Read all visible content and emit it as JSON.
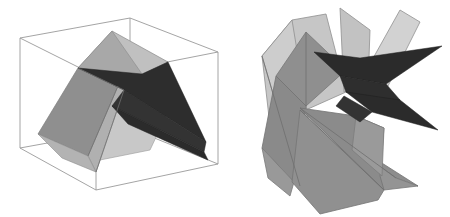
{
  "figure": {
    "title": "",
    "background_color": "#ffffff",
    "width": 450,
    "height": 217,
    "panels": [
      {
        "name": "left-panel",
        "label": "",
        "description": "Folded polygonal surface enclosed in a wireframe bounding box"
      },
      {
        "name": "right-panel",
        "label": "",
        "description": "Exploded arrangement of the same polygonal facets without bounding box"
      }
    ]
  },
  "palette": {
    "white": "#ffffff",
    "wireframe_stroke": "#8f8f8f",
    "outline_stroke": "#6e6e6e",
    "dark_face": "#2b2b2b",
    "dark_face_alt": "#333333",
    "mid_gray_face": "#8d8d8d",
    "mid_gray_face_b": "#999999",
    "light_gray_face": "#bdbdbd",
    "lighter_gray_face": "#cccccc",
    "pale_gray_face": "#d8d8d8",
    "shadow_gray": "#a6a6a6"
  },
  "left_panel": {
    "name": "wireframe-box-with-surface",
    "box_vertices": {
      "top_back_left": "20,38",
      "top_back_right": "130,18",
      "top_front_right": "218,52",
      "top_front_left": "96,76",
      "bottom_back_left": "20,148",
      "bottom_front_left": "96,190",
      "bottom_front_right": "218,164",
      "bottom_back_right": "130,128"
    },
    "surface_faces": [
      {
        "name": "upper-light-quad",
        "fill": "#b4b4b4"
      },
      {
        "name": "upper-mid-quad",
        "fill": "#9e9e9e"
      },
      {
        "name": "dark-wedge-upper",
        "fill": "#2b2b2b"
      },
      {
        "name": "dark-wedge-lower",
        "fill": "#2f2f2f"
      },
      {
        "name": "left-mid-band",
        "fill": "#8f8f8f"
      },
      {
        "name": "left-light-band",
        "fill": "#b0b0b0"
      }
    ]
  },
  "right_panel": {
    "name": "exploded-polygon-cluster",
    "surface_faces": [
      {
        "name": "back-pale-slab",
        "fill": "#c9c9c9"
      },
      {
        "name": "upper-left-light-quad",
        "fill": "#b8b8b8"
      },
      {
        "name": "upper-mid-quad",
        "fill": "#9a9a9a"
      },
      {
        "name": "top-right-pale-strip",
        "fill": "#cfcfcf"
      },
      {
        "name": "right-pale-bar",
        "fill": "#d2d2d2"
      },
      {
        "name": "dark-spike-upper",
        "fill": "#2b2b2b"
      },
      {
        "name": "dark-spike-lower",
        "fill": "#2f2f2f"
      },
      {
        "name": "mid-gray-blade",
        "fill": "#8a8a8a"
      },
      {
        "name": "long-gray-blade",
        "fill": "#909090"
      },
      {
        "name": "lower-left-slab",
        "fill": "#8d8d8d"
      },
      {
        "name": "lower-right-slab",
        "fill": "#959595"
      },
      {
        "name": "bottom-wedge",
        "fill": "#9a9a9a"
      }
    ]
  }
}
